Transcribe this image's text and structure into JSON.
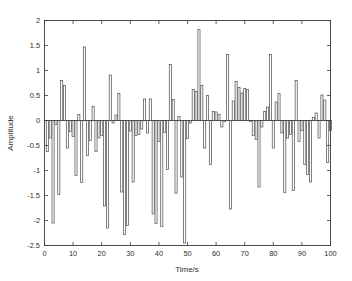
{
  "chart_data": {
    "type": "bar",
    "title": "",
    "subtitle": "",
    "xlabel": "Time/s",
    "ylabel": "Amplitude",
    "xlim": [
      0,
      100
    ],
    "ylim": [
      -2.5,
      2
    ],
    "xticks": [
      0,
      10,
      20,
      30,
      40,
      50,
      60,
      70,
      80,
      90,
      100
    ],
    "xtick_labels": [
      "0",
      "10",
      "20",
      "30",
      "40",
      "50",
      "60",
      "70",
      "80",
      "90",
      "100"
    ],
    "yticks": [
      -2.5,
      -2,
      -1.5,
      -1,
      -0.5,
      0,
      0.5,
      1,
      1.5,
      2
    ],
    "ytick_labels": [
      "-2.5",
      "-2",
      "-1.5",
      "-1",
      "-0.5",
      "0",
      "0.5",
      "1",
      "1.5",
      "2"
    ],
    "grid": false,
    "legend": null,
    "legend_position": "none",
    "bar_style": "outline",
    "bar_edge_color": "#555555",
    "bar_fill_color": "none",
    "axis_color": "#3a3a3a",
    "background_color": "#ffffff",
    "x": [
      1,
      2,
      3,
      4,
      5,
      6,
      7,
      8,
      9,
      10,
      11,
      12,
      13,
      14,
      15,
      16,
      17,
      18,
      19,
      20,
      21,
      22,
      23,
      24,
      25,
      26,
      27,
      28,
      29,
      30,
      31,
      32,
      33,
      34,
      35,
      36,
      37,
      38,
      39,
      40,
      41,
      42,
      43,
      44,
      45,
      46,
      47,
      48,
      49,
      50,
      51,
      52,
      53,
      54,
      55,
      56,
      57,
      58,
      59,
      60,
      61,
      62,
      63,
      64,
      65,
      66,
      67,
      68,
      69,
      70,
      71,
      72,
      73,
      74,
      75,
      76,
      77,
      78,
      79,
      80,
      81,
      82,
      83,
      84,
      85,
      86,
      87,
      88,
      89,
      90,
      91,
      92,
      93,
      94,
      95,
      96,
      97,
      98,
      99,
      100
    ],
    "values": [
      -0.62,
      -0.35,
      -2.05,
      -0.08,
      -1.48,
      0.8,
      0.7,
      -0.55,
      -0.22,
      -0.32,
      -1.1,
      0.12,
      -1.24,
      1.47,
      -0.7,
      -0.4,
      0.28,
      -0.62,
      -0.35,
      -0.3,
      -1.71,
      -2.15,
      0.91,
      -0.05,
      0.11,
      0.54,
      -1.43,
      -2.28,
      -2.1,
      -0.21,
      -1.23,
      -0.3,
      -0.28,
      -0.17,
      0.43,
      -0.25,
      0.43,
      -1.87,
      -2.06,
      -0.42,
      -2.12,
      -0.24,
      -0.98,
      1.12,
      0.42,
      -1.45,
      0.08,
      -1.13,
      -2.45,
      -0.36,
      -0.05,
      0.62,
      0.58,
      1.82,
      0.7,
      -0.55,
      0.5,
      -0.88,
      0.18,
      0.17,
      0.12,
      -0.13,
      -0.02,
      1.32,
      -1.77,
      0.39,
      0.78,
      0.66,
      0.55,
      0.64,
      0.62,
      -0.02,
      -0.3,
      -0.38,
      -1.33,
      -0.13,
      0.18,
      0.27,
      1.32,
      -0.55,
      0.37,
      0.54,
      -0.25,
      -1.44,
      -0.35,
      -0.28,
      -1.4,
      0.8,
      -0.42,
      -0.2,
      -0.88,
      -1.08,
      -1.23,
      0.06,
      0.15,
      -0.35,
      0.51,
      0.41,
      -0.84,
      -0.2
    ]
  }
}
